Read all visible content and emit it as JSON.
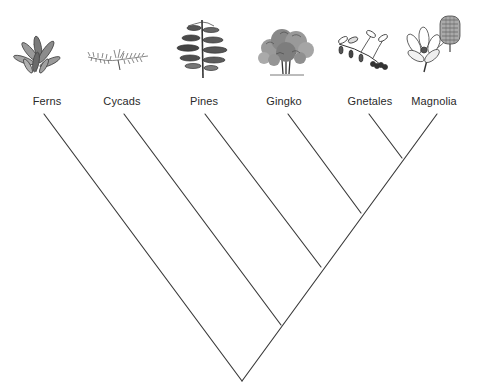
{
  "diagram": {
    "type": "cladogram",
    "line_color": "#3a3a3a",
    "taxa": [
      {
        "id": "ferns",
        "label": "Ferns",
        "illustration": "fern-plant-icon",
        "tip": [
          44,
          114
        ],
        "label_x": 47
      },
      {
        "id": "cycads",
        "label": "Cycads",
        "illustration": "cycad-frond-icon",
        "tip": [
          124,
          114
        ],
        "label_x": 122
      },
      {
        "id": "pines",
        "label": "Pines",
        "illustration": "pine-tree-icon",
        "tip": [
          205,
          114
        ],
        "label_x": 204
      },
      {
        "id": "gingko",
        "label": "Gingko",
        "illustration": "gingko-tree-icon",
        "tip": [
          288,
          114
        ],
        "label_x": 284
      },
      {
        "id": "gnetales",
        "label": "Gnetales",
        "illustration": "gnetales-branch-icon",
        "tip": [
          369,
          114
        ],
        "label_x": 370
      },
      {
        "id": "magnolia",
        "label": "Magnolia",
        "illustration": "magnolia-flower-icon",
        "tip": [
          437,
          114
        ],
        "label_x": 434
      }
    ],
    "nodes": [
      {
        "id": "gnetales-magnolia",
        "pos": [
          402,
          158
        ],
        "children": [
          "gnetales",
          "magnolia"
        ]
      },
      {
        "id": "gingko-clade",
        "pos": [
          361,
          213
        ],
        "children": [
          "gingko",
          "gnetales-magnolia"
        ]
      },
      {
        "id": "pines-clade",
        "pos": [
          321,
          267
        ],
        "children": [
          "pines",
          "gingko-clade"
        ]
      },
      {
        "id": "cycads-clade",
        "pos": [
          281,
          325
        ],
        "children": [
          "cycads",
          "pines-clade"
        ]
      },
      {
        "id": "root",
        "pos": [
          242,
          381
        ],
        "children": [
          "ferns",
          "cycads-clade"
        ]
      }
    ]
  }
}
